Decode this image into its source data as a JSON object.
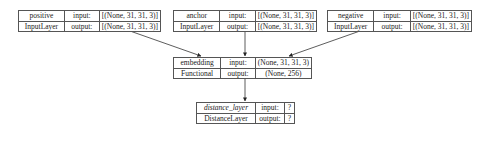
{
  "nodes": [
    {
      "id": "positive",
      "name": "positive",
      "type": "InputLayer",
      "input_label": "input:",
      "output_label": "output:",
      "input_shape": "[(None, 31, 31, 3)]",
      "output_shape": "[(None, 31, 31, 3)]"
    },
    {
      "id": "anchor",
      "name": "anchor",
      "type": "InputLayer",
      "input_label": "input:",
      "output_label": "output:",
      "input_shape": "[(None, 31, 31, 3)]",
      "output_shape": "[(None, 31, 31, 3)]"
    },
    {
      "id": "negative",
      "name": "negative",
      "type": "InputLayer",
      "input_label": "input:",
      "output_label": "output:",
      "input_shape": "[(None, 31, 31, 3)]",
      "output_shape": "[(None, 31, 31, 3)]"
    },
    {
      "id": "embedding",
      "name": "embedding",
      "type": "Functional",
      "input_label": "input:",
      "output_label": "output:",
      "input_shape": "(None, 31, 31, 3)",
      "output_shape": "(None, 256)"
    },
    {
      "id": "distance_layer",
      "name": "distance_layer",
      "type": "DistanceLayer",
      "input_label": "input:",
      "output_label": "output:",
      "input_shape": "?",
      "output_shape": "?"
    }
  ],
  "edges": [
    {
      "from": "positive",
      "to": "embedding"
    },
    {
      "from": "anchor",
      "to": "embedding"
    },
    {
      "from": "negative",
      "to": "embedding"
    },
    {
      "from": "embedding",
      "to": "distance_layer"
    }
  ],
  "colors": {
    "line": "#333333",
    "border": "#555555",
    "background": "#ffffff"
  }
}
